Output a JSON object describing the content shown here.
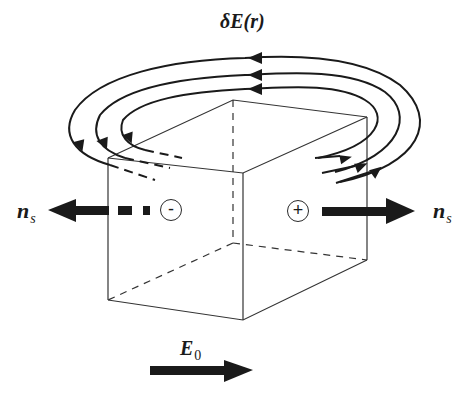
{
  "diagram": {
    "labels": {
      "field_perturbation": "δE(r)",
      "ns_left_main": "n",
      "ns_left_sub": "s",
      "ns_right_main": "n",
      "ns_right_sub": "s",
      "applied_field_main": "E",
      "applied_field_sub": "0"
    },
    "charges": {
      "left_face": "-",
      "right_face": "+"
    },
    "colors": {
      "ink": "#1a1a1a",
      "box_edge": "#333333",
      "background": "#ffffff"
    }
  }
}
